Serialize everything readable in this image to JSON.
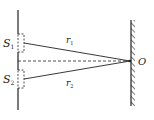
{
  "diagram": {
    "labels": {
      "s1": "S",
      "s1_sub": "1",
      "s2": "S",
      "s2_sub": "2",
      "r1": "r",
      "r1_sub": "1",
      "r2": "r",
      "r2_sub": "2",
      "o": "O"
    },
    "colors": {
      "line": "#222222",
      "background": "#ffffff"
    }
  }
}
